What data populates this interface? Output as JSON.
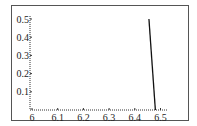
{
  "chart_data": {
    "type": "line",
    "title": "",
    "xlabel": "",
    "ylabel": "",
    "xlim": [
      6.0,
      6.5
    ],
    "ylim": [
      0.0,
      0.5
    ],
    "grid": false,
    "legend": null,
    "x_ticks": [
      "6",
      "6.1",
      "6.2",
      "6.3",
      "6.4",
      "6.5"
    ],
    "y_ticks": [
      "0.1",
      "0.2",
      "0.3",
      "0.4",
      "0.5"
    ],
    "series": [
      {
        "name": "curve",
        "color": "#111111",
        "x": [
          6.455,
          6.48
        ],
        "y": [
          0.5,
          0.0
        ]
      }
    ]
  },
  "axes": {
    "x_labels": [
      "6",
      "6.1",
      "6.2",
      "6.3",
      "6.4",
      "6.5"
    ],
    "y_labels": [
      "0.1",
      "0.2",
      "0.3",
      "0.4",
      "0.5"
    ]
  },
  "colors": {
    "line": "#111111",
    "axis": "#333333",
    "frame": "#555555"
  }
}
